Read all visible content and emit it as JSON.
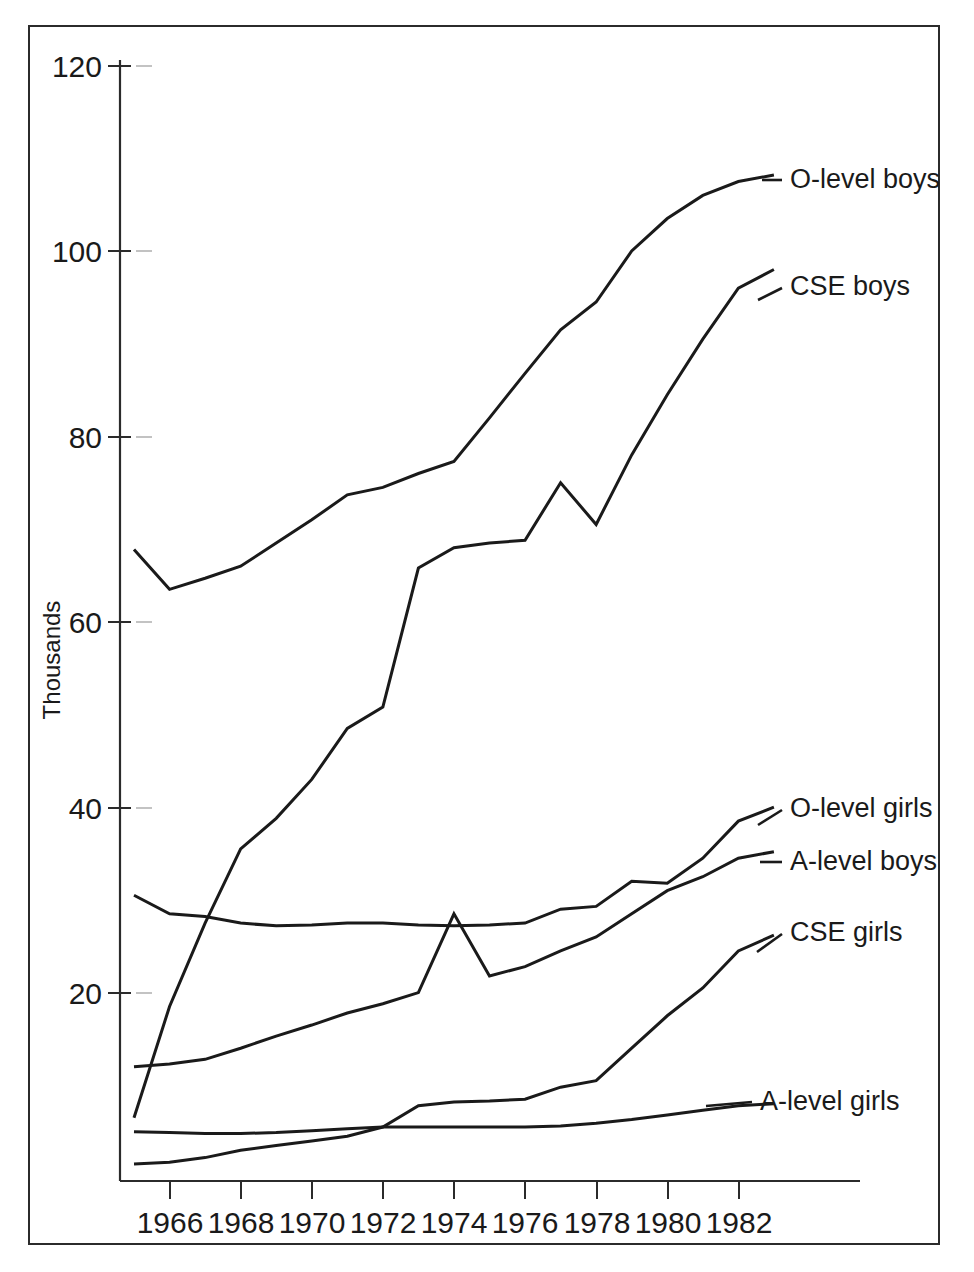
{
  "chart_data": {
    "type": "line",
    "title": "",
    "xlabel": "",
    "ylabel": "Thousands",
    "xlim": [
      1965,
      1983
    ],
    "ylim": [
      0,
      120
    ],
    "grid": false,
    "legend_position": "right-inline-labels",
    "x": [
      1965,
      1966,
      1967,
      1968,
      1969,
      1970,
      1971,
      1972,
      1973,
      1974,
      1975,
      1976,
      1977,
      1978,
      1979,
      1980,
      1981,
      1982,
      1983
    ],
    "xtick_labels": [
      "1966",
      "1968",
      "1970",
      "1972",
      "1974",
      "1976",
      "1978",
      "1980",
      "1982"
    ],
    "xtick_values": [
      1966,
      1968,
      1970,
      1972,
      1974,
      1976,
      1978,
      1980,
      1982
    ],
    "ytick_labels": [
      "20",
      "40",
      "60",
      "80",
      "100",
      "120"
    ],
    "ytick_values": [
      20,
      40,
      60,
      80,
      100,
      120
    ],
    "series": [
      {
        "name": "O-level boys",
        "label": "O-level boys",
        "values": [
          67.8,
          63.5,
          64.7,
          66.0,
          68.5,
          71.0,
          73.7,
          74.5,
          76.0,
          77.3,
          82.0,
          86.8,
          91.5,
          94.5,
          100.0,
          103.5,
          106.0,
          107.5,
          108.2
        ]
      },
      {
        "name": "CSE boys",
        "label": "CSE boys",
        "values": [
          6.5,
          18.5,
          27.5,
          35.5,
          38.8,
          43.0,
          48.5,
          50.8,
          65.8,
          68.0,
          68.5,
          68.8,
          75.0,
          70.5,
          78.0,
          84.5,
          90.5,
          96.0,
          98.0
        ]
      },
      {
        "name": "O-level girls",
        "label": "O-level girls",
        "values": [
          30.5,
          28.5,
          28.2,
          27.5,
          27.2,
          27.3,
          27.5,
          27.5,
          27.3,
          27.2,
          27.3,
          27.5,
          29.0,
          29.3,
          32.0,
          31.8,
          34.5,
          38.5,
          40.0
        ]
      },
      {
        "name": "A-level boys",
        "label": "A-level boys",
        "values": [
          12.0,
          12.3,
          12.8,
          14.0,
          15.3,
          16.5,
          17.8,
          18.8,
          20.0,
          28.5,
          21.8,
          22.8,
          24.5,
          26.0,
          28.5,
          31.0,
          32.5,
          34.5,
          35.2
        ]
      },
      {
        "name": "CSE girls",
        "label": "CSE girls",
        "values": [
          1.5,
          1.7,
          2.2,
          3.0,
          3.5,
          4.0,
          4.5,
          5.5,
          7.8,
          8.2,
          8.3,
          8.5,
          9.8,
          10.5,
          14.0,
          17.5,
          20.5,
          24.5,
          26.2
        ]
      },
      {
        "name": "A-level girls",
        "label": "A-level girls",
        "values": [
          5.0,
          4.9,
          4.8,
          4.8,
          4.9,
          5.1,
          5.3,
          5.5,
          5.5,
          5.5,
          5.5,
          5.5,
          5.6,
          5.9,
          6.3,
          6.8,
          7.3,
          7.8,
          8.0
        ]
      }
    ]
  }
}
